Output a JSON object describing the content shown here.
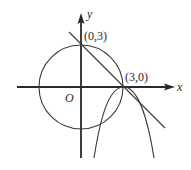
{
  "diagram": {
    "type": "coordinate-geometry",
    "axes": {
      "x_label": "x",
      "y_label": "y",
      "origin_label": "O"
    },
    "points": [
      {
        "label": "(0,3)",
        "x": 0,
        "y": 3
      },
      {
        "label": "(3,0)",
        "x": 3,
        "y": 0
      }
    ],
    "shapes": [
      {
        "kind": "circle",
        "center": [
          0,
          0
        ],
        "radius": 3
      },
      {
        "kind": "line",
        "through": [
          [
            0,
            3
          ],
          [
            3,
            0
          ]
        ]
      },
      {
        "kind": "curve",
        "description": "downward-opening curve with vertex near (3,0)"
      }
    ],
    "colors": {
      "stroke": "#2a2a2a",
      "background": "#ffffff"
    }
  }
}
